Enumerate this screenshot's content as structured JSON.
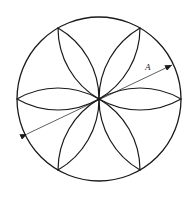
{
  "diagram": {
    "title": "",
    "shape": "circle with six-petal rosette",
    "circle": {
      "cx": 99,
      "cy": 99,
      "r": 82
    },
    "petals": 6,
    "dimension": {
      "label": "A",
      "from": [
        27,
        134
      ],
      "to": [
        172,
        65
      ],
      "arrows": "both"
    },
    "stroke_color": "#1a1a1a",
    "background": "#ffffff"
  }
}
